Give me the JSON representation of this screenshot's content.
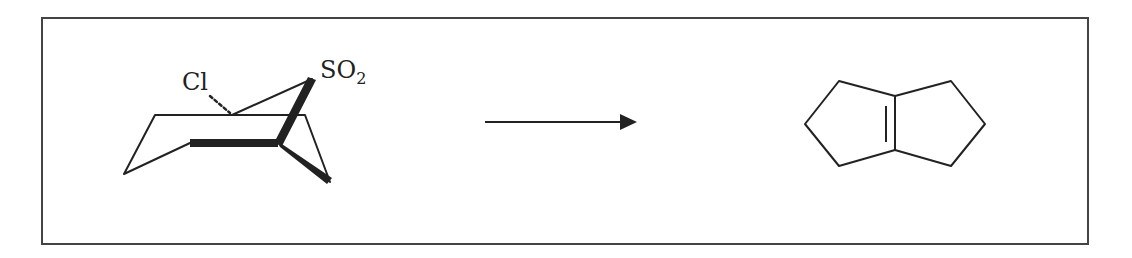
{
  "diagram": {
    "type": "chemical-reaction-scheme",
    "reactant": {
      "name": "bicyclic-sulfone",
      "labels": {
        "chlorine": "Cl",
        "sulfonyl": "SO",
        "sulfonyl_subscript": "2"
      }
    },
    "arrow": {
      "direction": "right"
    },
    "product": {
      "name": "bicyclo[3.3.0]oct-1(5)-ene"
    },
    "colors": {
      "stroke": "#222222",
      "frame": "#444444",
      "background": "#ffffff"
    }
  }
}
